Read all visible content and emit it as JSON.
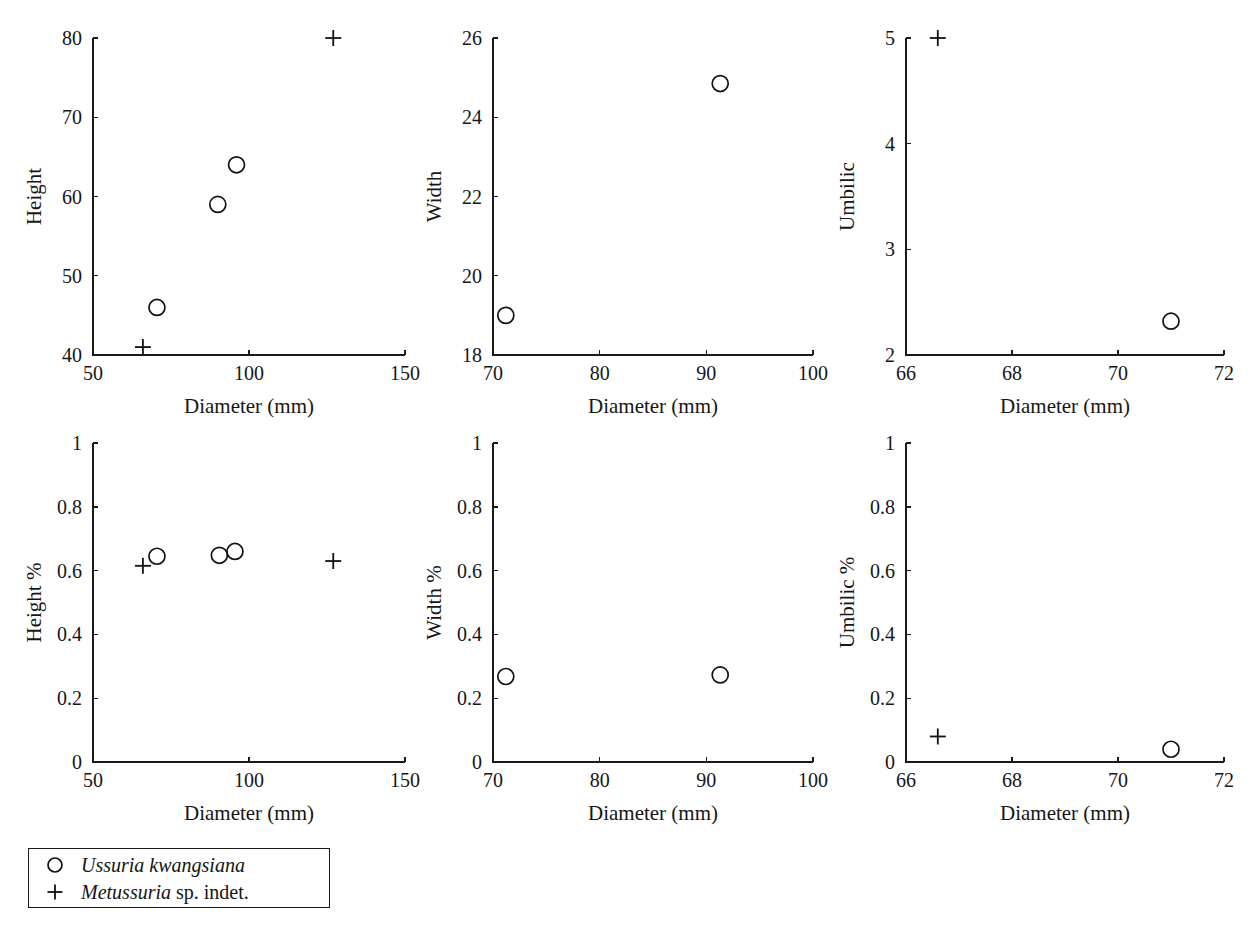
{
  "figure": {
    "background": "#ffffff",
    "ink_color": "#161616",
    "marker_color": "#111111"
  },
  "legend": {
    "entries": [
      {
        "marker": "circle-marker-icon",
        "name_italic": "Ussuria kwangsiana",
        "name_roman": ""
      },
      {
        "marker": "plus-marker-icon",
        "name_italic": "Metussuria",
        "name_roman": " sp. indet."
      }
    ]
  },
  "chart_data": [
    {
      "id": "height-vs-diameter",
      "type": "scatter",
      "title": "",
      "xlabel": "Diameter (mm)",
      "ylabel": "Height",
      "xlim": [
        50,
        150
      ],
      "ylim": [
        40,
        80
      ],
      "xticks": [
        50,
        100,
        150
      ],
      "xtick_labels": [
        "50",
        "100",
        "150"
      ],
      "yticks": [
        40,
        50,
        60,
        70,
        80
      ],
      "ytick_labels": [
        "40",
        "50",
        "60",
        "70",
        "80"
      ],
      "grid": false,
      "legend_position": "below-figure",
      "series": [
        {
          "name": "Ussuria kwangsiana",
          "marker": "circle",
          "points": [
            {
              "x": 70.5,
              "y": 46.0
            },
            {
              "x": 90.0,
              "y": 59.0
            },
            {
              "x": 96.0,
              "y": 64.0
            }
          ]
        },
        {
          "name": "Metussuria sp. indet.",
          "marker": "plus",
          "points": [
            {
              "x": 66.0,
              "y": 41.0
            },
            {
              "x": 127.0,
              "y": 80.0
            }
          ]
        }
      ]
    },
    {
      "id": "width-vs-diameter",
      "type": "scatter",
      "title": "",
      "xlabel": "Diameter (mm)",
      "ylabel": "Width",
      "xlim": [
        70,
        100
      ],
      "ylim": [
        18,
        26
      ],
      "xticks": [
        70,
        80,
        90,
        100
      ],
      "xtick_labels": [
        "70",
        "80",
        "90",
        "100"
      ],
      "yticks": [
        18,
        20,
        22,
        24,
        26
      ],
      "ytick_labels": [
        "18",
        "20",
        "22",
        "24",
        "26"
      ],
      "grid": false,
      "series": [
        {
          "name": "Ussuria kwangsiana",
          "marker": "circle",
          "points": [
            {
              "x": 71.2,
              "y": 19.0
            },
            {
              "x": 91.3,
              "y": 24.85
            }
          ]
        },
        {
          "name": "Metussuria sp. indet.",
          "marker": "plus",
          "points": []
        }
      ]
    },
    {
      "id": "umbilic-vs-diameter",
      "type": "scatter",
      "title": "",
      "xlabel": "Diameter (mm)",
      "ylabel": "Umbilic",
      "xlim": [
        66,
        72
      ],
      "ylim": [
        2,
        5
      ],
      "xticks": [
        66,
        68,
        70,
        72
      ],
      "xtick_labels": [
        "66",
        "68",
        "70",
        "72"
      ],
      "yticks": [
        2,
        3,
        4,
        5
      ],
      "ytick_labels": [
        "2",
        "3",
        "4",
        "5"
      ],
      "grid": false,
      "series": [
        {
          "name": "Ussuria kwangsiana",
          "marker": "circle",
          "points": [
            {
              "x": 71.0,
              "y": 2.32
            }
          ]
        },
        {
          "name": "Metussuria sp. indet.",
          "marker": "plus",
          "points": [
            {
              "x": 66.6,
              "y": 5.0
            }
          ]
        }
      ]
    },
    {
      "id": "height-percent-vs-diameter",
      "type": "scatter",
      "title": "",
      "xlabel": "Diameter (mm)",
      "ylabel": "Height %",
      "xlim": [
        50,
        150
      ],
      "ylim": [
        0,
        1
      ],
      "xticks": [
        50,
        100,
        150
      ],
      "xtick_labels": [
        "50",
        "100",
        "150"
      ],
      "yticks": [
        0,
        0.2,
        0.4,
        0.6,
        0.8,
        1
      ],
      "ytick_labels": [
        "0",
        "0.2",
        "0.4",
        "0.6",
        "0.8",
        "1"
      ],
      "grid": false,
      "series": [
        {
          "name": "Ussuria kwangsiana",
          "marker": "circle",
          "points": [
            {
              "x": 70.5,
              "y": 0.645
            },
            {
              "x": 90.5,
              "y": 0.648
            },
            {
              "x": 95.5,
              "y": 0.66
            }
          ]
        },
        {
          "name": "Metussuria sp. indet.",
          "marker": "plus",
          "points": [
            {
              "x": 66.0,
              "y": 0.615
            },
            {
              "x": 127.0,
              "y": 0.63
            }
          ]
        }
      ]
    },
    {
      "id": "width-percent-vs-diameter",
      "type": "scatter",
      "title": "",
      "xlabel": "Diameter (mm)",
      "ylabel": "Width %",
      "xlim": [
        70,
        100
      ],
      "ylim": [
        0,
        1
      ],
      "xticks": [
        70,
        80,
        90,
        100
      ],
      "xtick_labels": [
        "70",
        "80",
        "90",
        "100"
      ],
      "yticks": [
        0,
        0.2,
        0.4,
        0.6,
        0.8,
        1
      ],
      "ytick_labels": [
        "0",
        "0.2",
        "0.4",
        "0.6",
        "0.8",
        "1"
      ],
      "grid": false,
      "series": [
        {
          "name": "Ussuria kwangsiana",
          "marker": "circle",
          "points": [
            {
              "x": 71.2,
              "y": 0.268
            },
            {
              "x": 91.3,
              "y": 0.273
            }
          ]
        },
        {
          "name": "Metussuria sp. indet.",
          "marker": "plus",
          "points": []
        }
      ]
    },
    {
      "id": "umbilic-percent-vs-diameter",
      "type": "scatter",
      "title": "",
      "xlabel": "Diameter (mm)",
      "ylabel": "Umbilic %",
      "xlim": [
        66,
        72
      ],
      "ylim": [
        0,
        1
      ],
      "xticks": [
        66,
        68,
        70,
        72
      ],
      "xtick_labels": [
        "66",
        "68",
        "70",
        "72"
      ],
      "yticks": [
        0,
        0.2,
        0.4,
        0.6,
        0.8,
        1
      ],
      "ytick_labels": [
        "0",
        "0.2",
        "0.4",
        "0.6",
        "0.8",
        "1"
      ],
      "grid": false,
      "series": [
        {
          "name": "Ussuria kwangsiana",
          "marker": "circle",
          "points": [
            {
              "x": 71.0,
              "y": 0.04
            }
          ]
        },
        {
          "name": "Metussuria sp. indet.",
          "marker": "plus",
          "points": [
            {
              "x": 66.6,
              "y": 0.08
            }
          ]
        }
      ]
    }
  ]
}
